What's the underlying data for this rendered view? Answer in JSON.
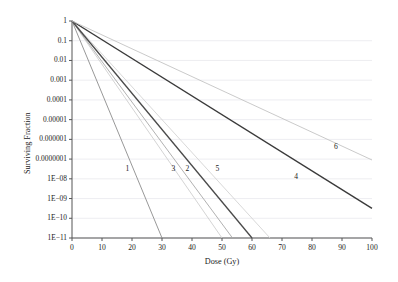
{
  "chart_data": {
    "type": "line",
    "title": "",
    "xlabel": "Dose (Gy)",
    "ylabel": "Surviving Fraction",
    "xlim": [
      0,
      100
    ],
    "ylim": [
      1e-11,
      1
    ],
    "yscale": "log",
    "grid": true,
    "grid_orientation": "horizontal",
    "legend": "inline-curve-labels",
    "x_ticks": [
      0,
      10,
      20,
      30,
      40,
      50,
      60,
      70,
      80,
      90,
      100
    ],
    "x_tick_labels": [
      "0",
      "10",
      "20",
      "30",
      "40",
      "50",
      "60",
      "70",
      "80",
      "90",
      "100"
    ],
    "y_ticks": [
      1,
      0.1,
      0.01,
      0.001,
      0.0001,
      1e-05,
      1e-06,
      1e-07,
      1e-08,
      1e-09,
      1e-10,
      1e-11
    ],
    "y_tick_labels": [
      "1",
      "0.1",
      "0.01",
      "0.001",
      "0.0001",
      "0.00001",
      "0.000001",
      "0.0000001",
      "1E−08",
      "1E−09",
      "1E−10",
      "1E−11"
    ],
    "series": [
      {
        "name": "1",
        "color": "#8c8c8c",
        "width": 0.9,
        "label": "1",
        "label_x": 18.5,
        "label_y": 3e-08,
        "points": [
          [
            0,
            1
          ],
          [
            30,
            1e-11
          ]
        ]
      },
      {
        "name": "2",
        "color": "#cfcfcf",
        "width": 0.9,
        "label": "2",
        "label_x": 38.5,
        "label_y": 3e-08,
        "points": [
          [
            0,
            1
          ],
          [
            50,
            1e-11
          ]
        ]
      },
      {
        "name": "3",
        "color": "#a8a8a8",
        "width": 0.9,
        "label": "3",
        "label_x": 33.8,
        "label_y": 3e-08,
        "points": [
          [
            0,
            1
          ],
          [
            53.5,
            1e-11
          ]
        ]
      },
      {
        "name": "4",
        "color": "#3a3a3a",
        "width": 1.4,
        "label": "4",
        "label_x": 74.7,
        "label_y": 1.2e-08,
        "points": [
          [
            0,
            1
          ],
          [
            100,
            3.2e-10
          ]
        ]
      },
      {
        "name": "5",
        "color": "#4a4a4a",
        "width": 1.3,
        "label": "5",
        "label_x": 48.5,
        "label_y": 3e-08,
        "points": [
          [
            0,
            1
          ],
          [
            60,
            1e-11
          ]
        ]
      },
      {
        "name": "6",
        "color": "#c4c4c4",
        "width": 0.9,
        "label": "6",
        "label_x": 88.0,
        "label_y": 4e-07,
        "points": [
          [
            0,
            1
          ],
          [
            100,
            9e-08
          ]
        ]
      }
    ],
    "extra_curve": {
      "name": "7",
      "color": "#d4d4d4",
      "width": 0.9,
      "points": [
        [
          0,
          1
        ],
        [
          66,
          1e-11
        ]
      ]
    }
  },
  "axes_style": {
    "axis_color": "#555555",
    "grid_color": "#e8e8ee",
    "text_color": "#1b1b1b",
    "background": "#ffffff"
  }
}
